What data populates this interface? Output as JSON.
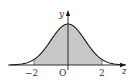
{
  "chart_data": {
    "type": "area",
    "title": "",
    "xlabel": "z",
    "ylabel": "y",
    "origin_label": "O",
    "x_ticks": [
      {
        "value": -2,
        "label": "−2"
      },
      {
        "value": 0,
        "label": "0"
      },
      {
        "value": 2,
        "label": "2"
      }
    ],
    "xlim": [
      -3.4,
      3.4
    ],
    "shaded_interval": [
      -2,
      2
    ],
    "function": "standard normal pdf",
    "grid": false,
    "legend": null
  },
  "colors": {
    "curve": "#1a1a1a",
    "shade": "#c8c8c8",
    "axis": "#1a1a1a"
  }
}
